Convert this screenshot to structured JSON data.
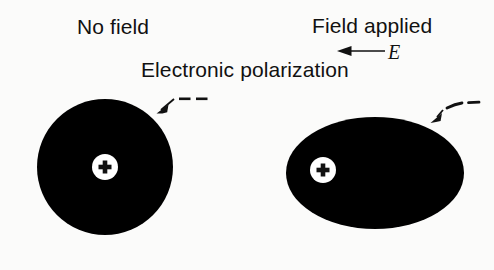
{
  "figure": {
    "title": "Electronic polarization",
    "background_color": "#fbfbfa",
    "ink_color": "#111111",
    "labels": {
      "no_field": "No field",
      "field_applied": "Field applied",
      "electronic_polarization": "Electronic polarization",
      "field_symbol": "E"
    },
    "panels": [
      {
        "id": "no-field",
        "state_label": "No field",
        "atom_shape": "circle",
        "center": {
          "x": 105,
          "y": 167
        },
        "radius_x": 68,
        "radius_y": 68,
        "electron_cloud_color": "#000000",
        "nucleus": {
          "symbol": "+",
          "charge": "positive",
          "center": {
            "x": 105,
            "y": 167
          },
          "radius": 13,
          "fill": "#ffffff",
          "offset_from_center": 0
        },
        "electron_annotation": {
          "symbol": "− −",
          "charge": "negative",
          "dash_count": 2,
          "pointer": "arrow"
        }
      },
      {
        "id": "field-applied",
        "state_label": "Field applied",
        "atom_shape": "ellipse",
        "center": {
          "x": 375,
          "y": 173
        },
        "radius_x": 89,
        "radius_y": 56,
        "electron_cloud_color": "#000000",
        "nucleus": {
          "symbol": "+",
          "charge": "positive",
          "center": {
            "x": 323,
            "y": 170
          },
          "radius": 13,
          "fill": "#ffffff",
          "offset_from_center": -52
        },
        "electron_annotation": {
          "symbol": "− −",
          "charge": "negative",
          "dash_count": 2,
          "pointer": "arrow"
        }
      }
    ],
    "field_arrow": {
      "symbol": "E",
      "direction": "left",
      "from": {
        "x": 385,
        "y": 51
      },
      "to": {
        "x": 338,
        "y": 51
      }
    }
  }
}
